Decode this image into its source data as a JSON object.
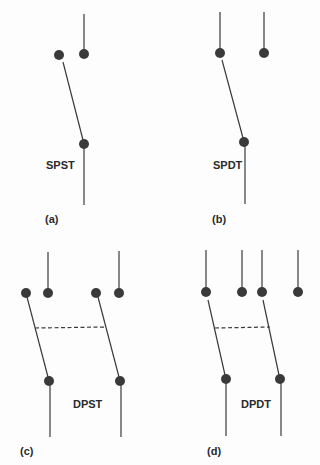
{
  "colors": {
    "line": "#3a3a3a",
    "dot": "#3a3a3a",
    "background": "#fdfdfd"
  },
  "panels": [
    {
      "id": "a",
      "caption": "(a)",
      "label": "SPST",
      "description": "Single pole single throw switch"
    },
    {
      "id": "b",
      "caption": "(b)",
      "label": "SPDT",
      "description": "Single pole double throw switch"
    },
    {
      "id": "c",
      "caption": "(c)",
      "label": "DPST",
      "description": "Double pole single throw switch"
    },
    {
      "id": "d",
      "caption": "(d)",
      "label": "DPDT",
      "description": "Double pole double throw switch"
    }
  ]
}
